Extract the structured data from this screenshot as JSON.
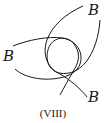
{
  "figure": {
    "caption": "(VIII)",
    "labels": {
      "top_right": "B",
      "left": "B",
      "bottom_right": "B"
    },
    "stroke_color": "#1a1a1a",
    "background_color": "#ffffff"
  }
}
